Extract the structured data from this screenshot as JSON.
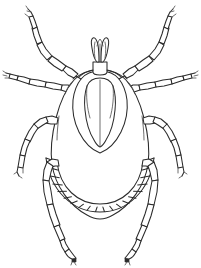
{
  "figure": {
    "view": "dorsal",
    "style": "black-and-white line art",
    "background_color": "#ffffff",
    "ink_color": "#2b2b2b",
    "width": 201,
    "height": 268,
    "caption": ""
  },
  "anatomy": {
    "capitulum": {
      "label": "capitulum",
      "palp_count": 2,
      "center_x": 100,
      "top_y": 38
    },
    "scutum": {
      "label": "scutum",
      "shape": "pointed shield",
      "center_x": 100,
      "top_y": 78,
      "bottom_y": 152
    },
    "idiosoma": {
      "label": "body",
      "shape": "oval",
      "center_x": 100,
      "widest_y": 160
    },
    "festoons": {
      "label": "festoons",
      "count": 16,
      "arc_center_x": 100,
      "arc_center_y": 140,
      "arc_radius": 64
    },
    "legs": {
      "label": "legs",
      "total": 8,
      "per_side": 4,
      "segments_per_leg": 6,
      "pairs": [
        {
          "name": "leg-pair-1",
          "direction": "upper-outward"
        },
        {
          "name": "leg-pair-2",
          "direction": "lateral-horizontal"
        },
        {
          "name": "leg-pair-3",
          "direction": "lower-lateral"
        },
        {
          "name": "leg-pair-4",
          "direction": "downward"
        }
      ]
    }
  }
}
